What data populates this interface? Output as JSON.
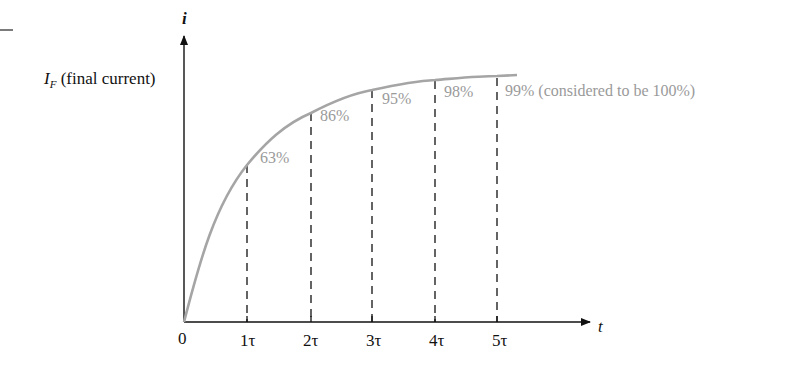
{
  "diagram": {
    "type": "rc_charging_current_curve",
    "y_axis": {
      "label": "i",
      "marker_label_main": "I",
      "marker_label_sub": "F",
      "marker_label_rest": " (final current)"
    },
    "x_axis": {
      "label": "t",
      "origin": "0",
      "ticks": [
        "1τ",
        "2τ",
        "3τ",
        "4τ",
        "5τ"
      ]
    },
    "annotations": [
      {
        "tick": "1τ",
        "text": "63%"
      },
      {
        "tick": "2τ",
        "text": "86%"
      },
      {
        "tick": "3τ",
        "text": "95%"
      },
      {
        "tick": "4τ",
        "text": "98%"
      },
      {
        "tick": "5τ",
        "text": "99% (considered to be 100%)"
      }
    ],
    "colors": {
      "axis": "#111111",
      "curve": "#a0a0a0",
      "annotation_text": "#9a9a9a"
    }
  }
}
